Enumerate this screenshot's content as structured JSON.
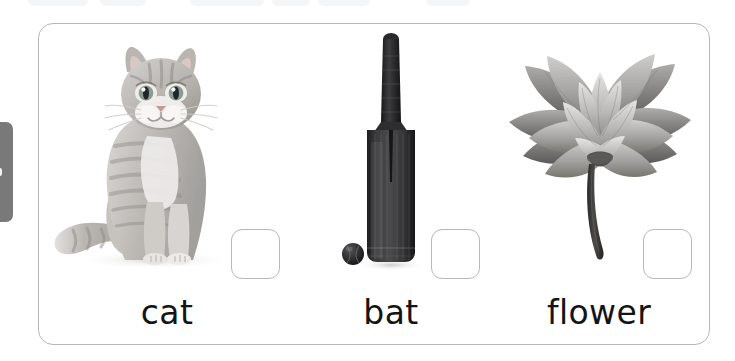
{
  "page": {
    "background_color": "#ffffff",
    "card_border_color": "#b6b6b6"
  },
  "edge_chrome": {
    "left_bar": {
      "name": "cut-off-sidebar-bar",
      "color": "#6e6e6e"
    },
    "top_ghosts": [
      {
        "left": 28,
        "width": 60
      },
      {
        "left": 100,
        "width": 46
      },
      {
        "left": 190,
        "width": 74
      },
      {
        "left": 272,
        "width": 38
      },
      {
        "left": 318,
        "width": 52
      },
      {
        "left": 426,
        "width": 44
      }
    ]
  },
  "worksheet": {
    "items": [
      {
        "word": "cat",
        "picture": "cat-photo",
        "picture_description": "grayscale tabby cat sitting facing forward with tail to the left",
        "checkbox_checked": false,
        "checkbox_label": "answer-box-cat"
      },
      {
        "word": "bat",
        "picture": "cricket-bat-photo",
        "picture_description": "grayscale cricket bat standing upright with a ball at its base",
        "checkbox_checked": false,
        "checkbox_label": "answer-box-bat"
      },
      {
        "word": "flower",
        "picture": "lotus-flower-photo",
        "picture_description": "grayscale lotus flower with pointed petals on a curving stem",
        "checkbox_checked": false,
        "checkbox_label": "answer-box-flower"
      }
    ]
  }
}
